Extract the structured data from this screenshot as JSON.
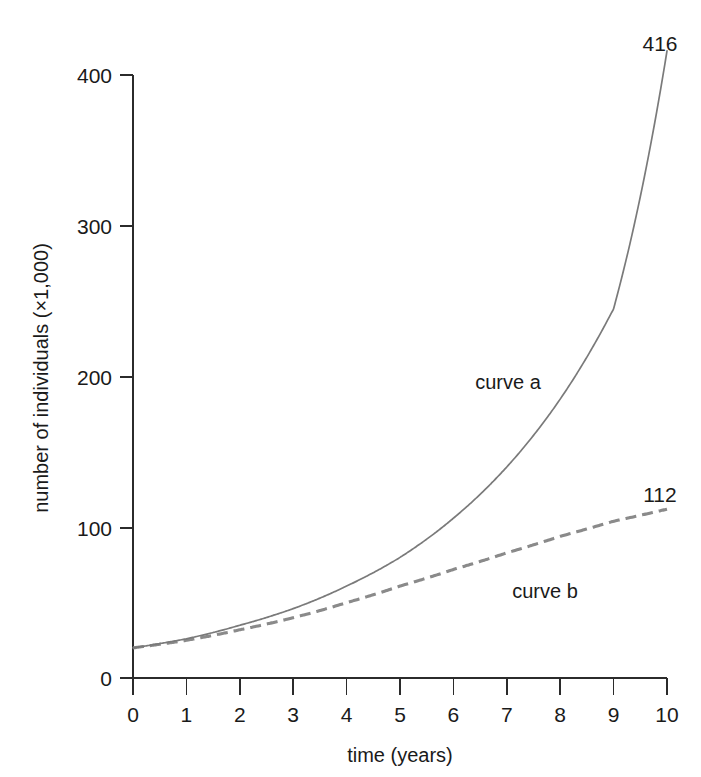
{
  "chart_data": {
    "type": "line",
    "title": "",
    "xlabel": "time (years)",
    "ylabel": "number of individuals (×1,000)",
    "xlim": [
      0,
      10
    ],
    "ylim": [
      0,
      400
    ],
    "grid": false,
    "legend": "inline-annotations",
    "x_ticks": [
      "0",
      "1",
      "2",
      "3",
      "4",
      "5",
      "6",
      "7",
      "8",
      "9",
      "10"
    ],
    "x_tick_values": [
      0,
      1,
      2,
      3,
      4,
      5,
      6,
      7,
      8,
      9,
      10
    ],
    "y_ticks": [
      "0",
      "100",
      "200",
      "300",
      "400"
    ],
    "y_tick_values": [
      0,
      100,
      200,
      300,
      400
    ],
    "x": [
      0,
      1,
      2,
      3,
      4,
      5,
      6,
      7,
      8,
      9,
      10
    ],
    "series": [
      {
        "name": "curve a",
        "style": "solid",
        "color": "#7a7a7a",
        "label": "curve a",
        "end_label": "416",
        "end_value": 416,
        "values": [
          20,
          26,
          35,
          46,
          61,
          80,
          106,
          140,
          185,
          245,
          416
        ]
      },
      {
        "name": "curve b",
        "style": "dashed",
        "color": "#8a8a8a",
        "label": "curve b",
        "end_label": "112",
        "end_value": 112,
        "values": [
          20,
          25,
          32,
          40,
          50,
          61,
          72,
          83,
          94,
          104,
          112
        ]
      }
    ],
    "annotations": [
      {
        "text": "curve a",
        "x": 6.0,
        "y": 200
      },
      {
        "text": "curve b",
        "x": 7.4,
        "y": 58
      },
      {
        "text": "416",
        "x": 10.0,
        "y": 416
      },
      {
        "text": "112",
        "x": 10.0,
        "y": 112
      }
    ]
  },
  "axes": {
    "y_label": "number of individuals (×1,000)",
    "x_label": "time (years)",
    "y_tick_0": "0",
    "y_tick_100": "100",
    "y_tick_200": "200",
    "y_tick_300": "300",
    "y_tick_400": "400",
    "x_tick_0": "0",
    "x_tick_1": "1",
    "x_tick_2": "2",
    "x_tick_3": "3",
    "x_tick_4": "4",
    "x_tick_5": "5",
    "x_tick_6": "6",
    "x_tick_7": "7",
    "x_tick_8": "8",
    "x_tick_9": "9",
    "x_tick_10": "10"
  },
  "labels": {
    "curve_a": "curve a",
    "curve_b": "curve b",
    "end_a": "416",
    "end_b": "112"
  },
  "colors": {
    "curve_a": "#7a7a7a",
    "curve_b": "#8a8a8a",
    "axis": "#2b2b2b",
    "text": "#1a1a1a",
    "background": "#ffffff"
  }
}
